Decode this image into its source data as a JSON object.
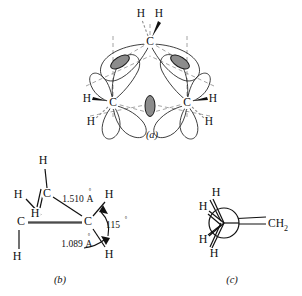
{
  "figure": {
    "panels": [
      {
        "id": "a",
        "caption": "(a)",
        "description": "bent banana bond orbital overlap in cyclopropane",
        "carbon_label": "C",
        "hydrogen_label": "H",
        "carbons": [
          {
            "label": "C",
            "x": 150,
            "y": 42
          },
          {
            "label": "C",
            "x": 113,
            "y": 103
          },
          {
            "label": "C",
            "x": 187,
            "y": 103
          }
        ],
        "hydrogens": [
          {
            "label": "H",
            "x": 141,
            "y": 14
          },
          {
            "label": "H",
            "x": 159,
            "y": 14
          },
          {
            "label": "H",
            "x": 87,
            "y": 99
          },
          {
            "label": "H",
            "x": 91,
            "y": 122
          },
          {
            "label": "H",
            "x": 213,
            "y": 99
          },
          {
            "label": "H",
            "x": 209,
            "y": 122
          }
        ],
        "bond_lobes": 3,
        "lobe_color": "#8c8c8c",
        "axis_color": "#9a9a9a"
      },
      {
        "id": "b",
        "caption": "(b)",
        "description": "cyclopropane geometry with bond length and bond angle values",
        "atoms": [
          {
            "label": "H",
            "x": 43,
            "y": 161
          },
          {
            "label": "H",
            "x": 18,
            "y": 195
          },
          {
            "label": "C",
            "x": 47,
            "y": 194
          },
          {
            "label": "H",
            "x": 35,
            "y": 214
          },
          {
            "label": "C",
            "x": 21,
            "y": 222
          },
          {
            "label": "H",
            "x": 17,
            "y": 257
          },
          {
            "label": "C",
            "x": 88,
            "y": 222
          },
          {
            "label": "H",
            "x": 109,
            "y": 195
          },
          {
            "label": "H",
            "x": 109,
            "y": 255
          }
        ],
        "measurements": [
          {
            "name": "cc-bond-length",
            "value": "1.510",
            "unit": "A",
            "superscript": "°",
            "x": 76,
            "y": 200
          },
          {
            "name": "ch-bond-length",
            "value": "1.089",
            "unit": "A",
            "superscript": "°",
            "x": 75,
            "y": 245
          },
          {
            "name": "hch-bond-angle",
            "value": "115",
            "unit": "°",
            "x": 114,
            "y": 226
          }
        ]
      },
      {
        "id": "c",
        "caption": "(c)",
        "description": "Newman-type end-on projection of methylenecyclopropane fragment",
        "atoms": [
          {
            "label": "H",
            "x": 216,
            "y": 193
          },
          {
            "label": "H",
            "x": 203,
            "y": 207
          },
          {
            "label": "H",
            "x": 203,
            "y": 240
          },
          {
            "label": "H",
            "x": 214,
            "y": 254
          }
        ],
        "group_label": "CH",
        "group_subscript": "2",
        "group_x": 272,
        "group_y": 224,
        "bond_type": "double"
      }
    ]
  }
}
